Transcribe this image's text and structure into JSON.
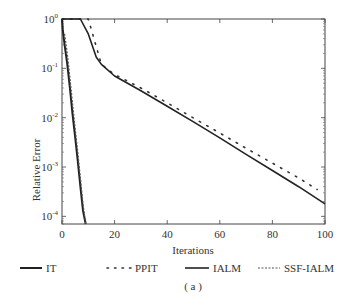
{
  "chart_data": {
    "type": "line",
    "title": "",
    "caption": "( a )",
    "xlabel": "Iterations",
    "ylabel": "Relative Error",
    "yscale": "log",
    "xlim": [
      0,
      100
    ],
    "ylim": [
      7e-05,
      1
    ],
    "xticks": [
      0,
      20,
      40,
      60,
      80,
      100
    ],
    "xtick_labels": [
      "0",
      "20",
      "40",
      "60",
      "80",
      "100"
    ],
    "yticks": [
      1,
      0.1,
      0.01,
      0.001,
      0.0001
    ],
    "ytick_labels": [
      "10^0",
      "10^-1",
      "10^-2",
      "10^-3",
      "10^-4"
    ],
    "grid": false,
    "legend_position": "bottom",
    "series": [
      {
        "name": "IT",
        "style": "solid-thick",
        "x": [
          0,
          0.3,
          1,
          2,
          3,
          4,
          5,
          6,
          7,
          8,
          9
        ],
        "y": [
          1,
          0.6,
          0.3,
          0.12,
          0.04,
          0.012,
          0.004,
          0.0013,
          0.0004,
          0.00013,
          7e-05
        ]
      },
      {
        "name": "PPIT",
        "style": "dotted",
        "x": [
          0,
          10,
          15,
          20,
          30,
          40,
          50,
          60,
          70,
          80,
          90,
          97
        ],
        "y": [
          1,
          1,
          0.12,
          0.075,
          0.04,
          0.02,
          0.0098,
          0.0049,
          0.0024,
          0.0012,
          0.0006,
          0.00035
        ]
      },
      {
        "name": "IALM",
        "style": "solid",
        "x": [
          0,
          5,
          7,
          10,
          13,
          15,
          20,
          30,
          40,
          50,
          60,
          70,
          80,
          90,
          100
        ],
        "y": [
          1,
          1,
          1,
          0.5,
          0.17,
          0.12,
          0.07,
          0.035,
          0.017,
          0.0082,
          0.0039,
          0.0018,
          0.00085,
          0.0004,
          0.00018
        ]
      },
      {
        "name": "SSF-IALM",
        "style": "dashed",
        "x": [
          1,
          2,
          3,
          4,
          5,
          6,
          7,
          8,
          9
        ],
        "y": [
          0.5,
          0.2,
          0.065,
          0.02,
          0.006,
          0.002,
          0.0006,
          0.00018,
          7e-05
        ]
      }
    ]
  },
  "legend": [
    {
      "label": "IT"
    },
    {
      "label": "PPIT"
    },
    {
      "label": "IALM"
    },
    {
      "label": "SSF-IALM"
    }
  ],
  "axes": {
    "xlabel": "Iterations",
    "ylabel": "Relative Error",
    "xticks": [
      "0",
      "20",
      "40",
      "60",
      "80",
      "100"
    ],
    "yticks": [
      {
        "base": "10",
        "exp": "0"
      },
      {
        "base": "10",
        "exp": "-1"
      },
      {
        "base": "10",
        "exp": "-2"
      },
      {
        "base": "10",
        "exp": "-3"
      },
      {
        "base": "10",
        "exp": "-4"
      }
    ]
  },
  "caption": "( a )"
}
